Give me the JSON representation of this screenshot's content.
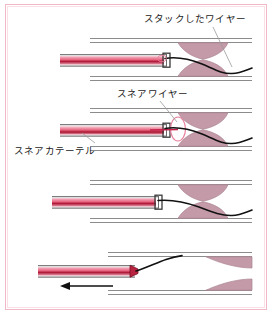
{
  "figure": {
    "panel_count": 4,
    "border_color": "#f0b9c6",
    "background_color": "#ffffff"
  },
  "labels": {
    "stuck_wire": "スタックしたワイヤー",
    "snare_wire": "スネアワイヤー",
    "snare_catheter": "スネアカテーテル"
  },
  "colors": {
    "lesion_fill": "#c59aa8",
    "lesion_stroke": "#a87f8e",
    "vessel_wall": "#8c8c8c",
    "catheter_outer": "#8f8f8f",
    "catheter_lumen": "#d8days",
    "catheter_pink": "#e05a7d",
    "catheter_red": "#b01838",
    "wire_black": "#111111",
    "snare_loop": "#e87f9c",
    "leader_line": "#9a9a9a",
    "text": "#1a1a1a"
  },
  "panels": [
    {
      "id": "panel-1",
      "order": 1,
      "description": "snare-catheter-advanced-to-lesion-stuck-wire-crossing",
      "has_snare_loop": false,
      "has_arrow": false
    },
    {
      "id": "panel-2",
      "order": 2,
      "description": "snare-loop-deployed-capturing-stuck-wire",
      "has_snare_loop": true,
      "has_arrow": false
    },
    {
      "id": "panel-3",
      "order": 3,
      "description": "snare-loop-closed-on-wire",
      "has_snare_loop": false,
      "has_arrow": false
    },
    {
      "id": "panel-4",
      "order": 4,
      "description": "catheter-and-captured-wire-withdrawn",
      "has_snare_loop": false,
      "has_arrow": true,
      "arrow_direction": "left"
    }
  ]
}
